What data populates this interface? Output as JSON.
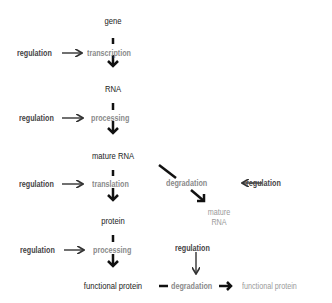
{
  "nodes": {
    "gene": "gene",
    "rna": "RNA",
    "mature_rna": "mature RNA",
    "protein": "protein",
    "functional_protein": "functional protein"
  },
  "processes": {
    "transcription": "transcription",
    "processing_rna": "processing",
    "translation": "translation",
    "processing_protein": "processing",
    "degradation_rna": "degradation",
    "degradation_protein": "degradation"
  },
  "regulation_label": "regulation",
  "regulations": [
    {
      "target": "transcription",
      "label": "regulation"
    },
    {
      "target": "processing_rna",
      "label": "regulation"
    },
    {
      "target": "translation",
      "label": "regulation"
    },
    {
      "target": "degradation_rna",
      "label": "regulation"
    },
    {
      "target": "processing_protein",
      "label": "regulation"
    },
    {
      "target": "degradation_protein",
      "label": "regulation"
    }
  ],
  "degraded_products": {
    "mature_rna_line1": "mature",
    "mature_rna_line2": "RNA",
    "functional_protein": "functional protein"
  },
  "colors": {
    "node_text": "#222222",
    "process_text": "#8a8a8a",
    "regulation_text": "#444444",
    "arrow": "#111111"
  }
}
